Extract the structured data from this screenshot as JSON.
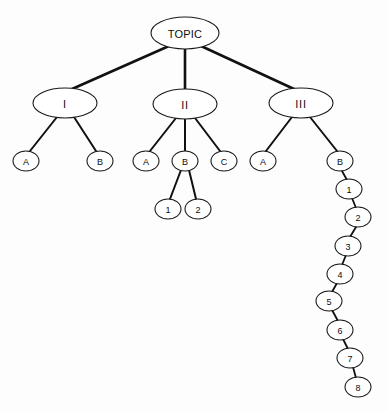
{
  "diagram": {
    "kind": "tree-outline-diagram",
    "background_color": "#fdfdfd",
    "node_fill_color": "#ffffff",
    "node_stroke_color": "#1a1a1a",
    "edge_color": "#111111",
    "nodes": [
      {
        "id": "topic",
        "label": "TOPIC",
        "cx": 185,
        "cy": 33,
        "rx": 34,
        "ry": 16,
        "size": "root"
      },
      {
        "id": "i",
        "label": "I",
        "cx": 65,
        "cy": 103,
        "rx": 32,
        "ry": 15,
        "size": "level2"
      },
      {
        "id": "ii",
        "label": "II",
        "cx": 185,
        "cy": 104,
        "rx": 32,
        "ry": 15,
        "size": "level2"
      },
      {
        "id": "iii",
        "label": "III",
        "cx": 301,
        "cy": 103,
        "rx": 32,
        "ry": 15,
        "size": "level2"
      },
      {
        "id": "i-a",
        "label": "A",
        "cx": 26,
        "cy": 161,
        "rx": 13,
        "ry": 10,
        "size": "small"
      },
      {
        "id": "i-b",
        "label": "B",
        "cx": 100,
        "cy": 161,
        "rx": 13,
        "ry": 10,
        "size": "small"
      },
      {
        "id": "ii-a",
        "label": "A",
        "cx": 146,
        "cy": 161,
        "rx": 13,
        "ry": 10,
        "size": "small"
      },
      {
        "id": "ii-b",
        "label": "B",
        "cx": 185,
        "cy": 161,
        "rx": 13,
        "ry": 10,
        "size": "small"
      },
      {
        "id": "ii-c",
        "label": "C",
        "cx": 224,
        "cy": 161,
        "rx": 13,
        "ry": 10,
        "size": "small"
      },
      {
        "id": "ii-b-1",
        "label": "1",
        "cx": 168,
        "cy": 209,
        "rx": 13,
        "ry": 10,
        "size": "small"
      },
      {
        "id": "ii-b-2",
        "label": "2",
        "cx": 198,
        "cy": 209,
        "rx": 13,
        "ry": 10,
        "size": "small"
      },
      {
        "id": "iii-a",
        "label": "A",
        "cx": 263,
        "cy": 161,
        "rx": 13,
        "ry": 10,
        "size": "small"
      },
      {
        "id": "iii-b",
        "label": "B",
        "cx": 340,
        "cy": 161,
        "rx": 13,
        "ry": 10,
        "size": "small"
      },
      {
        "id": "c1",
        "label": "1",
        "cx": 349,
        "cy": 189,
        "rx": 13,
        "ry": 10,
        "size": "small"
      },
      {
        "id": "c2",
        "label": "2",
        "cx": 358,
        "cy": 217,
        "rx": 13,
        "ry": 10,
        "size": "small"
      },
      {
        "id": "c3",
        "label": "3",
        "cx": 348,
        "cy": 246,
        "rx": 13,
        "ry": 10,
        "size": "small"
      },
      {
        "id": "c4",
        "label": "4",
        "cx": 340,
        "cy": 274,
        "rx": 13,
        "ry": 10,
        "size": "small"
      },
      {
        "id": "c5",
        "label": "5",
        "cx": 329,
        "cy": 301,
        "rx": 13,
        "ry": 10,
        "size": "small"
      },
      {
        "id": "c6",
        "label": "6",
        "cx": 340,
        "cy": 330,
        "rx": 13,
        "ry": 10,
        "size": "small"
      },
      {
        "id": "c7",
        "label": "7",
        "cx": 350,
        "cy": 358,
        "rx": 13,
        "ry": 10,
        "size": "small"
      },
      {
        "id": "c8",
        "label": "8",
        "cx": 358,
        "cy": 387,
        "rx": 13,
        "ry": 10,
        "size": "small"
      }
    ],
    "edges": [
      {
        "from": "topic",
        "to": "i",
        "x1": 169,
        "y1": 46,
        "x2": 72,
        "y2": 89,
        "width": 2.6
      },
      {
        "from": "topic",
        "to": "ii",
        "x1": 185,
        "y1": 49,
        "x2": 185,
        "y2": 89,
        "width": 2.6
      },
      {
        "from": "topic",
        "to": "iii",
        "x1": 201,
        "y1": 46,
        "x2": 294,
        "y2": 89,
        "width": 2.6
      },
      {
        "from": "i",
        "to": "i-a",
        "x1": 57,
        "y1": 117,
        "x2": 30,
        "y2": 151,
        "width": 2.0
      },
      {
        "from": "i",
        "to": "i-b",
        "x1": 74,
        "y1": 117,
        "x2": 96,
        "y2": 151,
        "width": 2.0
      },
      {
        "from": "ii",
        "to": "ii-a",
        "x1": 176,
        "y1": 118,
        "x2": 150,
        "y2": 151,
        "width": 2.0
      },
      {
        "from": "ii",
        "to": "ii-b",
        "x1": 185,
        "y1": 119,
        "x2": 185,
        "y2": 151,
        "width": 2.0
      },
      {
        "from": "ii",
        "to": "ii-c",
        "x1": 195,
        "y1": 118,
        "x2": 220,
        "y2": 151,
        "width": 2.0
      },
      {
        "from": "ii-b",
        "to": "ii-b-1",
        "x1": 181,
        "y1": 170,
        "x2": 170,
        "y2": 199,
        "width": 2.0
      },
      {
        "from": "ii-b",
        "to": "ii-b-2",
        "x1": 189,
        "y1": 170,
        "x2": 196,
        "y2": 199,
        "width": 2.0
      },
      {
        "from": "iii",
        "to": "iii-a",
        "x1": 292,
        "y1": 117,
        "x2": 266,
        "y2": 151,
        "width": 2.0
      },
      {
        "from": "iii",
        "to": "iii-b",
        "x1": 310,
        "y1": 117,
        "x2": 337,
        "y2": 151,
        "width": 2.0
      },
      {
        "from": "iii-b",
        "to": "c1",
        "x1": 342,
        "y1": 171,
        "x2": 347,
        "y2": 180,
        "width": 1.8
      },
      {
        "from": "c1",
        "to": "c2",
        "x1": 352,
        "y1": 198,
        "x2": 356,
        "y2": 208,
        "width": 1.8
      },
      {
        "from": "c2",
        "to": "c3",
        "x1": 356,
        "y1": 227,
        "x2": 350,
        "y2": 237,
        "width": 1.8
      },
      {
        "from": "c3",
        "to": "c4",
        "x1": 346,
        "y1": 255,
        "x2": 342,
        "y2": 265,
        "width": 1.8
      },
      {
        "from": "c4",
        "to": "c5",
        "x1": 337,
        "y1": 283,
        "x2": 332,
        "y2": 292,
        "width": 1.8
      },
      {
        "from": "c5",
        "to": "c6",
        "x1": 332,
        "y1": 310,
        "x2": 338,
        "y2": 321,
        "width": 1.8
      },
      {
        "from": "c6",
        "to": "c7",
        "x1": 343,
        "y1": 339,
        "x2": 348,
        "y2": 349,
        "width": 1.8
      },
      {
        "from": "c7",
        "to": "c8",
        "x1": 353,
        "y1": 367,
        "x2": 356,
        "y2": 378,
        "width": 1.8
      }
    ]
  }
}
